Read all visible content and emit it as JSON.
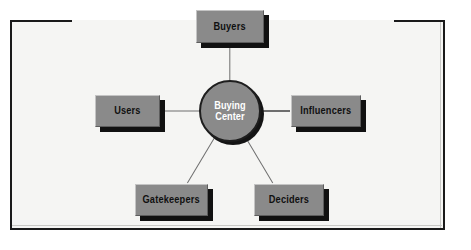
{
  "diagram": {
    "type": "hub-and-spoke",
    "background_color": "#f5f5f3",
    "node_fill_color": "#8a8a8a",
    "node_text_color": "#101010",
    "hub_text_color": "#ffffff",
    "border_color": "#1a1a1a",
    "connector_color": "#6e6e6e",
    "hub": {
      "label": "Buying\nCenter",
      "line1": "Buying",
      "line2": "Center"
    },
    "nodes": [
      {
        "id": "buyers",
        "label": "Buyers",
        "position": "top"
      },
      {
        "id": "influencers",
        "label": "Influencers",
        "position": "right"
      },
      {
        "id": "deciders",
        "label": "Deciders",
        "position": "bottom-right"
      },
      {
        "id": "gatekeepers",
        "label": "Gatekeepers",
        "position": "bottom-left"
      },
      {
        "id": "users",
        "label": "Users",
        "position": "left"
      }
    ]
  }
}
